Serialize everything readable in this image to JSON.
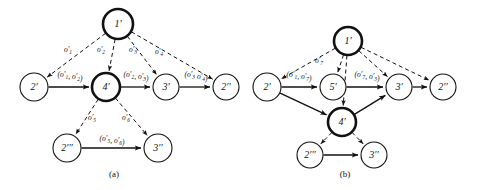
{
  "figure": {
    "background_color": "#ffffff",
    "ink_color": "#111111"
  },
  "panels": [
    {
      "id": "a",
      "caption": "(a)",
      "nodes": [
        {
          "id": "a1",
          "label": "1'",
          "x": 118,
          "y": 24,
          "r": 15,
          "emphasis": "thick"
        },
        {
          "id": "a2",
          "label": "2'",
          "x": 34,
          "y": 87,
          "r": 14,
          "emphasis": "thin"
        },
        {
          "id": "a4",
          "label": "4'",
          "x": 106,
          "y": 87,
          "r": 14,
          "emphasis": "thick"
        },
        {
          "id": "a3",
          "label": "3'",
          "x": 166,
          "y": 87,
          "r": 13,
          "emphasis": "thin"
        },
        {
          "id": "a2b",
          "label": "2''",
          "x": 226,
          "y": 87,
          "r": 13,
          "emphasis": "thin"
        },
        {
          "id": "a2c",
          "label": "2'''",
          "x": 67,
          "y": 148,
          "r": 14,
          "emphasis": "thin"
        },
        {
          "id": "a3b",
          "label": "3''",
          "x": 158,
          "y": 148,
          "r": 14,
          "emphasis": "thin"
        }
      ],
      "dashed_edges": [
        {
          "from": "a1",
          "to": "a2",
          "label": "o'1",
          "label_x": 68,
          "label_y": 52
        },
        {
          "from": "a1",
          "to": "a4",
          "label": "o'2",
          "label_x": 101,
          "label_y": 52
        },
        {
          "from": "a1",
          "to": "a3",
          "label": "o'3",
          "label_x": 133,
          "label_y": 52
        },
        {
          "from": "a1",
          "to": "a2b",
          "label": "o'4",
          "label_x": 159,
          "label_y": 54
        },
        {
          "from": "a4",
          "to": "a2c",
          "label": "o'5",
          "label_x": 92,
          "label_y": 120
        },
        {
          "from": "a4",
          "to": "a3b",
          "label": "o'6",
          "label_x": 126,
          "label_y": 120
        }
      ],
      "solid_edges": [
        {
          "from": "a2",
          "to": "a4",
          "label": "(o'1, o'2)",
          "label_x": 70,
          "label_y": 77
        },
        {
          "from": "a4",
          "to": "a3",
          "label": "(o'2, o'3)",
          "label_x": 136,
          "label_y": 77
        },
        {
          "from": "a3",
          "to": "a2b",
          "label": "(o'3 o'4)",
          "label_x": 196,
          "label_y": 77
        },
        {
          "from": "a2c",
          "to": "a3b",
          "label": "(o'5, o'6)",
          "label_x": 112,
          "label_y": 141
        }
      ]
    },
    {
      "id": "b",
      "caption": "(b)",
      "nodes": [
        {
          "id": "b1",
          "label": "1'",
          "x": 348,
          "y": 41,
          "r": 14,
          "emphasis": "thick"
        },
        {
          "id": "b2",
          "label": "2'",
          "x": 267,
          "y": 87,
          "r": 14,
          "emphasis": "thin"
        },
        {
          "id": "b5",
          "label": "5'",
          "x": 333,
          "y": 87,
          "r": 13,
          "emphasis": "thin"
        },
        {
          "id": "b3",
          "label": "3'",
          "x": 399,
          "y": 87,
          "r": 13,
          "emphasis": "thin"
        },
        {
          "id": "b2b",
          "label": "2''",
          "x": 443,
          "y": 87,
          "r": 13,
          "emphasis": "thin"
        },
        {
          "id": "b4",
          "label": "4'",
          "x": 342,
          "y": 122,
          "r": 14,
          "emphasis": "thick"
        },
        {
          "id": "b2c",
          "label": "2'''",
          "x": 310,
          "y": 155,
          "r": 13,
          "emphasis": "thin"
        },
        {
          "id": "b3b",
          "label": "3''",
          "x": 374,
          "y": 155,
          "r": 13,
          "emphasis": "thin"
        }
      ],
      "dashed_edges": [
        {
          "from": "b1",
          "to": "b2",
          "label": "",
          "label_x": 0,
          "label_y": 0
        },
        {
          "from": "b1",
          "to": "b5",
          "label": "o'7",
          "label_x": 319,
          "label_y": 63
        },
        {
          "from": "b1",
          "to": "b4",
          "label": "",
          "label_x": 0,
          "label_y": 0
        },
        {
          "from": "b1",
          "to": "b3",
          "label": "",
          "label_x": 0,
          "label_y": 0
        },
        {
          "from": "b1",
          "to": "b2b",
          "label": "",
          "label_x": 0,
          "label_y": 0
        },
        {
          "from": "b4",
          "to": "b2c",
          "label": "",
          "label_x": 0,
          "label_y": 0
        },
        {
          "from": "b4",
          "to": "b3b",
          "label": "",
          "label_x": 0,
          "label_y": 0
        }
      ],
      "solid_edges": [
        {
          "from": "b2",
          "to": "b5",
          "label": "(o'1, o'7)",
          "label_x": 299,
          "label_y": 77
        },
        {
          "from": "b5",
          "to": "b3",
          "label": "(o'7, o'3)",
          "label_x": 367,
          "label_y": 77
        },
        {
          "from": "b3",
          "to": "b2b",
          "label": "",
          "label_x": 0,
          "label_y": 0
        },
        {
          "from": "b2",
          "to": "b4",
          "label": "",
          "label_x": 0,
          "label_y": 0
        },
        {
          "from": "b4",
          "to": "b3",
          "label": "",
          "label_x": 0,
          "label_y": 0
        },
        {
          "from": "b2c",
          "to": "b3b",
          "label": "",
          "label_x": 0,
          "label_y": 0
        }
      ]
    }
  ],
  "captions": {
    "a": {
      "text": "(a)",
      "x": 114,
      "y": 177
    },
    "b": {
      "text": "(b)",
      "x": 345,
      "y": 177
    }
  },
  "operation_labels": {
    "o1": "o'1",
    "o2": "o'2",
    "o3": "o'3",
    "o4": "o'4",
    "o5": "o'5",
    "o6": "o'6",
    "o7": "o'7"
  }
}
